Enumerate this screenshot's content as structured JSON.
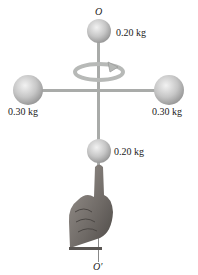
{
  "diagram": {
    "axis_top_label": "O",
    "axis_bottom_label": "O′",
    "masses": {
      "top": "0.20 kg",
      "left": "0.30 kg",
      "right": "0.30 kg",
      "bottom": "0.20 kg"
    },
    "rotation_direction": "counterclockwise (viewed from above)",
    "colors": {
      "rod": "#a7a9a8",
      "sphere": "#c8c8c8",
      "arrow": "#b5b7b5",
      "hand": "#7f7a76",
      "text": "#222222"
    }
  }
}
